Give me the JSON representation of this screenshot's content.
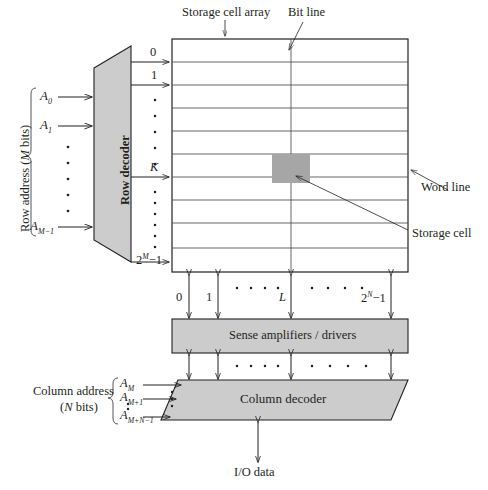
{
  "diagram": {
    "title_labels": {
      "storage_cell_array": "Storage cell array",
      "bit_line": "Bit line",
      "word_line": "Word line",
      "storage_cell": "Storage cell",
      "io_data": "I/O data"
    },
    "blocks": {
      "row_decoder": "Row decoder",
      "sense_amplifiers": "Sense amplifiers / drivers",
      "column_decoder": "Column decoder"
    },
    "row_address": {
      "caption_line1": "Row address (",
      "caption_italic": "M",
      "caption_line2": " bits)",
      "caption_full": "Row address (M bits)",
      "inputs": [
        "A0",
        "A1",
        "AM-1"
      ],
      "inputs_rendered": [
        "A₀",
        "A₁",
        "A_M−1"
      ]
    },
    "column_address": {
      "caption_line1": "Column address",
      "caption_line2": "(N bits)",
      "inputs": [
        "AM",
        "AM+1",
        "AM+N-1"
      ]
    },
    "row_indices": {
      "first": "0",
      "second": "1",
      "selected": "K",
      "last_base": "2",
      "last_exp": "M",
      "last_suffix": "−1"
    },
    "column_indices": {
      "first": "0",
      "second": "1",
      "selected": "L",
      "last_base": "2",
      "last_exp": "N",
      "last_suffix": "−1"
    },
    "colors": {
      "block_fill": "#cccccc",
      "cell_fill": "#a6a6a6",
      "stroke": "#231f20",
      "grid": "#4d4d4d"
    }
  }
}
